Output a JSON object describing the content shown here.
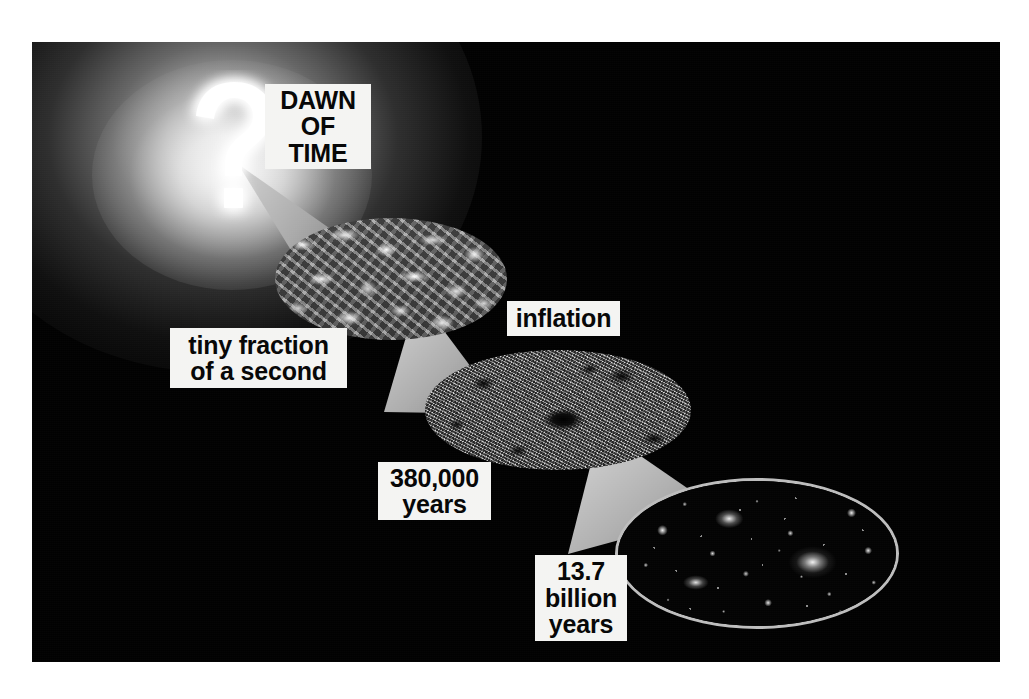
{
  "figure": {
    "background_color": "#010101",
    "page_background": "#ffffff"
  },
  "origin": {
    "symbol": "?",
    "symbol_name": "question-mark-glyph",
    "glow_color": "#ffffff"
  },
  "captions": {
    "dawn_of_time": "DAWN\nOF\nTIME",
    "tiny_fraction": "tiny fraction\nof a second",
    "inflation": "inflation",
    "years_380k": "380,000\nyears",
    "years_137b": "13.7\nbillion\nyears"
  },
  "stages": [
    {
      "name": "quantum-foam",
      "label": "tiny fraction of a second",
      "texture": "quantum-foam"
    },
    {
      "name": "cosmic-microwave-background",
      "label": "380,000 years",
      "texture": "cmb-map"
    },
    {
      "name": "galaxies",
      "label": "13.7 billion years",
      "texture": "galaxy-field",
      "outline_color": "#bdbdbd"
    }
  ],
  "cones": [
    {
      "name": "cone-dawn-to-foam",
      "color": "#b4b4b4"
    },
    {
      "name": "cone-foam-to-cmb",
      "color": "#b0b0b0"
    },
    {
      "name": "cone-cmb-to-galaxies",
      "color": "#b2b2b2"
    }
  ]
}
